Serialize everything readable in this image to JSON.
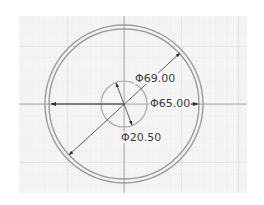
{
  "sketch": {
    "colors": {
      "background": "#ffffff",
      "grid_bg": "#f4f4f4",
      "grid_minor": "#e6e6e6",
      "grid_major": "#d2d2d2",
      "axis": "#9a9a9a",
      "circle": "#9b9b9b",
      "dimension": "#3a3a3a"
    },
    "center": {
      "x": 124,
      "y": 104
    },
    "circles": [
      {
        "name": "outer-circle",
        "r": 79
      },
      {
        "name": "inner-ring-circle",
        "r": 75
      },
      {
        "name": "hole-circle",
        "r": 23
      }
    ],
    "dimensions": [
      {
        "name": "dimension-d69",
        "label": "Φ69.00"
      },
      {
        "name": "dimension-d65",
        "label": "Φ65.00"
      },
      {
        "name": "dimension-d20",
        "label": "Φ20.50"
      }
    ]
  }
}
